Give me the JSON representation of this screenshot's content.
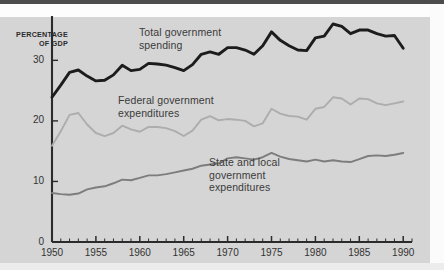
{
  "figure": {
    "width": 444,
    "height": 270,
    "background_color": "#d5d5d5"
  },
  "axis_unit_label": "PERCENTAGE\nOF GDP",
  "annotations": [
    {
      "name": "total-government-spending",
      "text": "Total government\nspending",
      "x": 139,
      "y": 26,
      "color": "#3a3a3a"
    },
    {
      "name": "federal-government-expenditures",
      "text": "Federal government\nexpenditures",
      "x": 118,
      "y": 94,
      "color": "#3a3a3a"
    },
    {
      "name": "state-and-local-government-expenditures",
      "text": "State and local\ngovernment\nexpenditures",
      "x": 209,
      "y": 156,
      "color": "#3a3a3a"
    }
  ],
  "colors": {
    "total_line": "#1c1c1c",
    "federal_line": "#adadad",
    "state_local_line": "#7d7d7d",
    "axis": "#2b2b2b",
    "plot_background": "#d5d5d5"
  },
  "chart_data": {
    "type": "line",
    "title": "",
    "xlabel": "",
    "ylabel": "PERCENTAGE OF GDP",
    "xlim": [
      1950,
      1991
    ],
    "ylim": [
      0,
      36
    ],
    "xticks": [
      1950,
      1955,
      1960,
      1965,
      1970,
      1975,
      1980,
      1985,
      1990
    ],
    "yticks": [
      0,
      10,
      20,
      30
    ],
    "minor_xtick_interval": 1,
    "grid": false,
    "legend": "inline-annotations",
    "x": [
      1950,
      1951,
      1952,
      1953,
      1954,
      1955,
      1956,
      1957,
      1958,
      1959,
      1960,
      1961,
      1962,
      1963,
      1964,
      1965,
      1966,
      1967,
      1968,
      1969,
      1970,
      1971,
      1972,
      1973,
      1974,
      1975,
      1976,
      1977,
      1978,
      1979,
      1980,
      1981,
      1982,
      1983,
      1984,
      1985,
      1986,
      1987,
      1988,
      1989,
      1990
    ],
    "series": [
      {
        "name": "Total government spending",
        "color": "#1c1c1c",
        "values": [
          23.9,
          25.9,
          28.0,
          28.4,
          27.4,
          26.6,
          26.7,
          27.6,
          29.2,
          28.3,
          28.5,
          29.5,
          29.4,
          29.2,
          28.8,
          28.3,
          29.3,
          31.0,
          31.4,
          31.0,
          32.1,
          32.1,
          31.7,
          31.0,
          32.4,
          34.7,
          33.3,
          32.4,
          31.7,
          31.6,
          33.7,
          34.0,
          36.0,
          35.6,
          34.4,
          35.0,
          35.0,
          34.4,
          34.0,
          34.1,
          32.0
        ]
      },
      {
        "name": "Federal government expenditures",
        "color": "#adadad",
        "values": [
          15.9,
          18.3,
          21.0,
          21.3,
          19.4,
          18.0,
          17.5,
          18.0,
          19.2,
          18.6,
          18.2,
          19.0,
          19.0,
          18.8,
          18.3,
          17.5,
          18.4,
          20.2,
          20.8,
          20.1,
          20.3,
          20.2,
          20.0,
          19.1,
          19.6,
          22.0,
          21.2,
          20.8,
          20.7,
          20.2,
          22.0,
          22.3,
          23.9,
          23.7,
          22.7,
          23.7,
          23.6,
          22.9,
          22.6,
          22.9,
          23.2
        ]
      },
      {
        "name": "State and local government expenditures",
        "color": "#7d7d7d",
        "values": [
          8.1,
          7.9,
          7.8,
          8.0,
          8.7,
          9.0,
          9.2,
          9.7,
          10.3,
          10.2,
          10.6,
          11.0,
          11.0,
          11.2,
          11.5,
          11.8,
          12.1,
          12.6,
          12.8,
          13.0,
          13.8,
          14.0,
          13.8,
          13.6,
          14.0,
          14.7,
          14.1,
          13.7,
          13.5,
          13.3,
          13.6,
          13.3,
          13.5,
          13.3,
          13.2,
          13.7,
          14.2,
          14.3,
          14.2,
          14.4,
          14.7
        ]
      }
    ]
  }
}
